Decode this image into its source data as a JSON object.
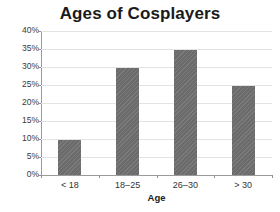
{
  "chart_data": {
    "type": "bar",
    "title": "Ages of Cosplayers",
    "xlabel": "Age",
    "ylabel": "",
    "categories": [
      "< 18",
      "18–25",
      "26–30",
      "> 30"
    ],
    "values": [
      9.8,
      29.6,
      34.7,
      24.7
    ],
    "value_unit": "%",
    "ylim": [
      0,
      40
    ],
    "ytick_step": 5,
    "ytick_labels": [
      "0%",
      "5%",
      "10%",
      "15%",
      "20%",
      "25%",
      "30%",
      "35%",
      "40%"
    ],
    "ytick_values": [
      0,
      5,
      10,
      15,
      20,
      25,
      30,
      35,
      40
    ],
    "grid": true,
    "grid_axis": "y",
    "legend": false,
    "legend_position": "none",
    "series": [
      {
        "name": "Percentage of cosplayers",
        "values": [
          9.8,
          29.6,
          34.7,
          24.7
        ]
      }
    ],
    "colors": {
      "bar_fill": "#6b6b6b",
      "gridline": "#e3e3e3",
      "axis": "#9a9a9a",
      "title_text": "#1a1a1a",
      "tick_text": "#3a3a3a",
      "background": "#ffffff"
    }
  }
}
